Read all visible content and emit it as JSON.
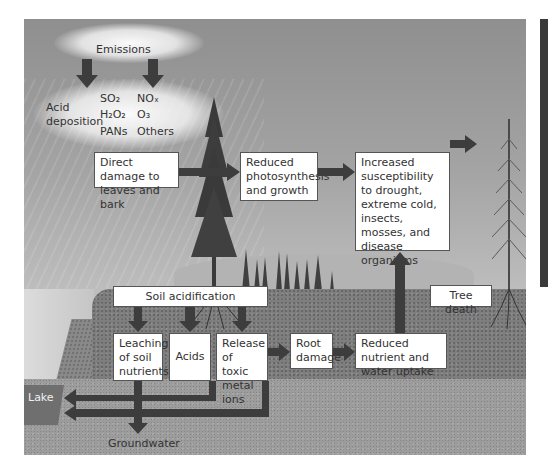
{
  "diagram": {
    "title_cloud": {
      "label": "Emissions"
    },
    "pollutants": {
      "left_column": [
        "SO₂",
        "H₂O₂",
        "PANs"
      ],
      "right_column": [
        "NOₓ",
        "O₃",
        "Others"
      ]
    },
    "acid_deposition_label": "Acid deposition",
    "above_ground_boxes": [
      {
        "id": "direct-damage",
        "text": "Direct damage to leaves and bark"
      },
      {
        "id": "reduced-photosynthesis",
        "text": "Reduced photosynthesis and growth"
      },
      {
        "id": "increased-susceptibility",
        "text": "Increased susceptibility to drought, extreme cold, insects, mosses, and disease organisms"
      }
    ],
    "soil_boxes": [
      {
        "id": "soil-acidification",
        "text": "Soil acidification"
      },
      {
        "id": "leaching",
        "text": "Leaching of soil nutrients"
      },
      {
        "id": "acids",
        "text": "Acids"
      },
      {
        "id": "toxic-metal-ions",
        "text": "Release of toxic metal ions"
      },
      {
        "id": "root-damage",
        "text": "Root damage"
      },
      {
        "id": "reduced-uptake",
        "text": "Reduced nutrient and water uptake"
      },
      {
        "id": "tree-death",
        "text": "Tree death"
      }
    ],
    "place_labels": {
      "lake": "Lake",
      "groundwater": "Groundwater"
    },
    "colors": {
      "sky_top": "#8f8f8f",
      "sky_bottom": "#c9c9c9",
      "soil": "#7e7e7e",
      "bedrock": "#9c9c9c",
      "arrow": "#3d3d3d",
      "box": "#ffffff"
    }
  }
}
